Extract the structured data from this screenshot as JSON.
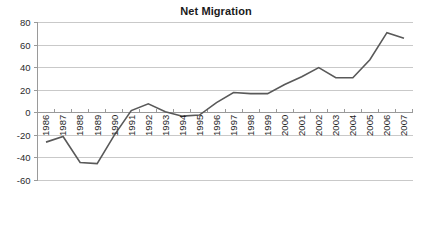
{
  "chart_data": {
    "type": "line",
    "title": "Net Migration",
    "xlabel": "",
    "ylabel": "",
    "x": [
      "1986",
      "1987",
      "1988",
      "1989",
      "1990",
      "1991",
      "1992",
      "1993",
      "1994",
      "1995",
      "1996",
      "1997",
      "1998",
      "1999",
      "2000",
      "2001",
      "2002",
      "2003",
      "2004",
      "2005",
      "2006",
      "2007"
    ],
    "categories": [
      "1986",
      "1987",
      "1988",
      "1989",
      "1990",
      "1991",
      "1992",
      "1993",
      "1994",
      "1995",
      "1996",
      "1997",
      "1998",
      "1999",
      "2000",
      "2001",
      "2002",
      "2003",
      "2004",
      "2005",
      "2006",
      "2007"
    ],
    "values": [
      -26,
      -21,
      -44,
      -45,
      -20,
      2,
      8,
      1,
      -3,
      -2,
      9,
      18,
      17,
      17,
      25,
      32,
      40,
      31,
      31,
      47,
      71,
      66
    ],
    "series": [
      {
        "name": "Net Migration",
        "values": [
          -26,
          -21,
          -44,
          -45,
          -20,
          2,
          8,
          1,
          -3,
          -2,
          9,
          18,
          17,
          17,
          25,
          32,
          40,
          31,
          31,
          47,
          71,
          66
        ]
      }
    ],
    "ylim": [
      -60,
      80
    ],
    "yticks": [
      80,
      60,
      40,
      20,
      0,
      -20,
      -40,
      -60
    ],
    "ytick_labels": [
      "80",
      "60",
      "40",
      "20",
      "0",
      "-20",
      "-40",
      "-60"
    ],
    "grid": true,
    "legend": false,
    "legend_position": "none",
    "line_color": "#595959",
    "grid_color": "#c9c9c9",
    "axis_color": "#9a9a9a",
    "background": "#ffffff"
  }
}
